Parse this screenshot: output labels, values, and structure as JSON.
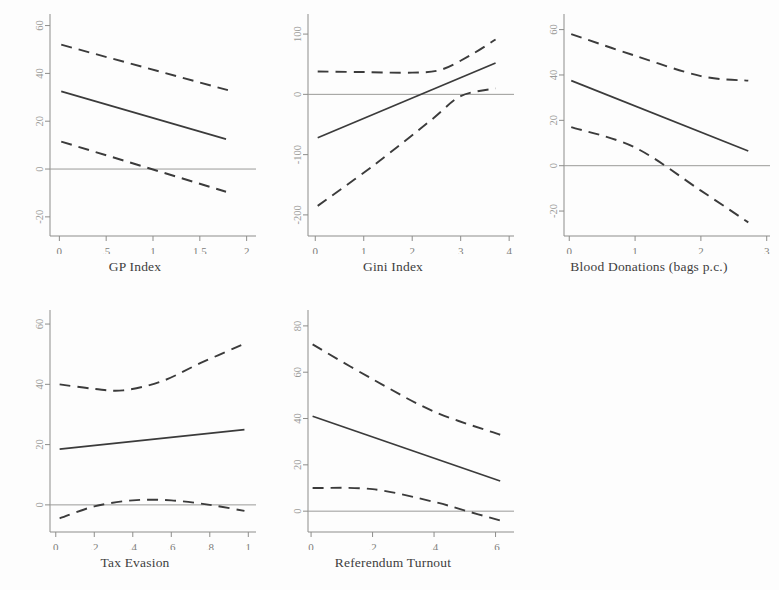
{
  "figure": {
    "kind": "multi-panel-marginal-effects",
    "panel_count": 5,
    "background": "#fdfdfd",
    "line_color": "#3b3b3b",
    "axis_color": "#8d8d8b",
    "tick_label_color": "#7d7d7b"
  },
  "chart_data": [
    {
      "id": "gp-index",
      "type": "line",
      "title": "",
      "xlabel": "GP Index",
      "ylabel": "",
      "xlim": [
        -0.1,
        2.1
      ],
      "ylim": [
        -28,
        64
      ],
      "xticks": [
        0,
        0.5,
        1,
        1.5,
        2
      ],
      "xticklabels": [
        "0",
        ".5",
        "1",
        "1.5",
        "2"
      ],
      "yticks": [
        -20,
        0,
        20,
        40,
        60
      ],
      "yticklabels": [
        "-20",
        "0",
        "20",
        "40",
        "60"
      ],
      "grid": false,
      "legend": "none",
      "zero_reference_line": 0,
      "series": [
        {
          "name": "fit",
          "style": "solid",
          "x": [
            0.02,
            1.78
          ],
          "values": [
            32.5,
            12.5
          ]
        },
        {
          "name": "upper_ci",
          "style": "dashed",
          "x": [
            0.02,
            1.8
          ],
          "values": [
            52.0,
            33.0
          ]
        },
        {
          "name": "lower_ci",
          "style": "dashed",
          "x": [
            0.02,
            1.78
          ],
          "values": [
            11.5,
            -9.5
          ]
        }
      ]
    },
    {
      "id": "gini-index",
      "type": "line",
      "title": "",
      "xlabel": "Gini Index",
      "ylabel": "",
      "xlim": [
        -0.15,
        4.1
      ],
      "ylim": [
        -235,
        130
      ],
      "xticks": [
        0,
        1,
        2,
        3,
        4
      ],
      "xticklabels": [
        "0",
        "1",
        "2",
        "3",
        "4"
      ],
      "yticks": [
        -200,
        -100,
        0,
        100
      ],
      "yticklabels": [
        "-200",
        "-100",
        "0",
        "100"
      ],
      "grid": false,
      "legend": "none",
      "zero_reference_line": 0,
      "series": [
        {
          "name": "fit",
          "style": "solid",
          "x": [
            0.05,
            3.72
          ],
          "values": [
            -72.0,
            52.0
          ]
        },
        {
          "name": "upper_ci",
          "style": "dashed",
          "x": [
            0.05,
            1.0,
            2.0,
            2.6,
            3.2,
            3.72
          ],
          "values": [
            38.0,
            37.0,
            36.0,
            41.0,
            65.0,
            91.0
          ]
        },
        {
          "name": "lower_ci",
          "style": "dashed",
          "x": [
            0.05,
            1.2,
            2.4,
            3.0,
            3.72
          ],
          "values": [
            -185.0,
            -118.0,
            -42.0,
            -3.0,
            10.0
          ]
        }
      ]
    },
    {
      "id": "blood-donations",
      "type": "line",
      "title": "",
      "xlabel": "Blood Donations (bags p.c.)",
      "ylabel": "",
      "xlim": [
        -0.08,
        3.05
      ],
      "ylim": [
        -31,
        66
      ],
      "xticks": [
        0,
        1,
        2,
        3
      ],
      "xticklabels": [
        "0",
        "1",
        "2",
        "3"
      ],
      "yticks": [
        -20,
        0,
        20,
        40,
        60
      ],
      "yticklabels": [
        "-20",
        "0",
        "20",
        "40",
        "60"
      ],
      "grid": false,
      "legend": "none",
      "zero_reference_line": 0,
      "series": [
        {
          "name": "fit",
          "style": "solid",
          "x": [
            0.03,
            2.72
          ],
          "values": [
            37.5,
            6.5
          ]
        },
        {
          "name": "upper_ci",
          "style": "dashed",
          "x": [
            0.03,
            1.0,
            2.0,
            2.72
          ],
          "values": [
            58.0,
            48.5,
            39.5,
            37.5
          ]
        },
        {
          "name": "lower_ci",
          "style": "dashed",
          "x": [
            0.03,
            1.0,
            2.0,
            2.72
          ],
          "values": [
            17.0,
            8.0,
            -11.0,
            -25.0
          ]
        }
      ]
    },
    {
      "id": "tax-evasion",
      "type": "line",
      "title": "",
      "xlabel": "Tax Evasion",
      "ylabel": "",
      "xlim": [
        -0.03,
        1.04
      ],
      "ylim": [
        -9,
        64
      ],
      "xticks": [
        0,
        0.2,
        0.4,
        0.6,
        0.8,
        1
      ],
      "xticklabels": [
        "0",
        ".2",
        ".4",
        ".6",
        ".8",
        "1"
      ],
      "yticks": [
        0,
        20,
        40,
        60
      ],
      "yticklabels": [
        "0",
        "20",
        "40",
        "60"
      ],
      "grid": false,
      "legend": "none",
      "zero_reference_line": 0,
      "series": [
        {
          "name": "fit",
          "style": "solid",
          "x": [
            0.02,
            0.98
          ],
          "values": [
            18.5,
            25.0
          ]
        },
        {
          "name": "upper_ci",
          "style": "dashed",
          "x": [
            0.02,
            0.2,
            0.35,
            0.55,
            0.75,
            0.98
          ],
          "values": [
            40.0,
            38.5,
            38.0,
            41.0,
            47.0,
            53.5
          ]
        },
        {
          "name": "lower_ci",
          "style": "dashed",
          "x": [
            0.02,
            0.2,
            0.4,
            0.6,
            0.8,
            0.98
          ],
          "values": [
            -4.5,
            -0.5,
            1.5,
            1.5,
            0.0,
            -2.0
          ]
        }
      ]
    },
    {
      "id": "referendum-turnout",
      "type": "line",
      "title": "",
      "xlabel": "Referendum Turnout",
      "ylabel": "",
      "xlim": [
        -0.01,
        0.66
      ],
      "ylim": [
        -9,
        86
      ],
      "xticks": [
        0,
        0.2,
        0.4,
        0.6
      ],
      "xticklabels": [
        "0",
        ".2",
        ".4",
        ".6"
      ],
      "yticks": [
        0,
        20,
        40,
        60,
        80
      ],
      "yticklabels": [
        "0",
        "20",
        "40",
        "60",
        "80"
      ],
      "grid": false,
      "legend": "none",
      "zero_reference_line": 0,
      "series": [
        {
          "name": "fit",
          "style": "solid",
          "x": [
            0.005,
            0.615
          ],
          "values": [
            41.0,
            13.0
          ]
        },
        {
          "name": "upper_ci",
          "style": "dashed",
          "x": [
            0.005,
            0.2,
            0.4,
            0.615
          ],
          "values": [
            72.0,
            57.0,
            43.0,
            33.0
          ]
        },
        {
          "name": "lower_ci",
          "style": "dashed",
          "x": [
            0.005,
            0.2,
            0.4,
            0.52,
            0.615
          ],
          "values": [
            10.0,
            9.5,
            4.0,
            -0.5,
            -4.0
          ]
        }
      ]
    }
  ]
}
